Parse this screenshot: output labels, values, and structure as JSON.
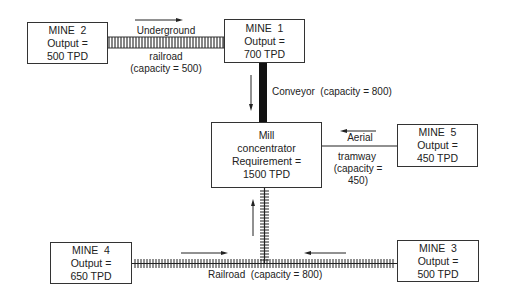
{
  "nodes": {
    "mine2": {
      "name": "MINE  2",
      "line2": "Output =",
      "line3": "500 TPD"
    },
    "mine1": {
      "name": "MINE  1",
      "line2": "Output =",
      "line3": "700 TPD"
    },
    "mill": {
      "name": "Mill",
      "line2": "concentrator",
      "line3": "Requirement =",
      "line4": "1500 TPD"
    },
    "mine5": {
      "name": "MINE  5",
      "line2": "Output =",
      "line3": "450 TPD"
    },
    "mine4": {
      "name": "MINE  4",
      "line2": "Output =",
      "line3": "650 TPD"
    },
    "mine3": {
      "name": "MINE  3",
      "line2": "Output =",
      "line3": "500 TPD"
    }
  },
  "links": {
    "underground": {
      "top": "Underground",
      "line2": "railroad",
      "line3": "(capacity = 500)"
    },
    "conveyor": {
      "label": "Conveyor  (capacity = 800)"
    },
    "aerial": {
      "top": "Aerial",
      "line2": "tramway",
      "line3": "(capacity =",
      "line4": "450)"
    },
    "railroad": {
      "label": "Railroad  (capacity = 800)"
    }
  },
  "colors": {
    "line": "#222222",
    "background": "#ffffff"
  }
}
